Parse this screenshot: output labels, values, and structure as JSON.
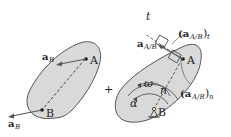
{
  "diagram": {
    "left_panel": {
      "points": [
        "A",
        "B"
      ],
      "vectors": [
        {
          "label": "a",
          "subscript": "B",
          "at": "A"
        },
        {
          "label": "a",
          "subscript": "B",
          "at": "B"
        }
      ]
    },
    "operator": "+",
    "right_panel": {
      "points": [
        "A",
        "B"
      ],
      "axes": {
        "tangential": "t",
        "normal": "n"
      },
      "vectors": [
        {
          "label": "a",
          "subscript": "A/B"
        },
        {
          "label": "(a",
          "subscript": "A/B",
          "suffix": ")",
          "suffix_sub": "t"
        },
        {
          "label": "(a",
          "subscript": "A/B",
          "suffix": ")",
          "suffix_sub": "n"
        }
      ],
      "angular": {
        "omega": "ω",
        "alpha": "α"
      }
    },
    "colors": {
      "body_fill": "#d9d9d9",
      "outline": "#555555",
      "text": "#222222"
    }
  }
}
